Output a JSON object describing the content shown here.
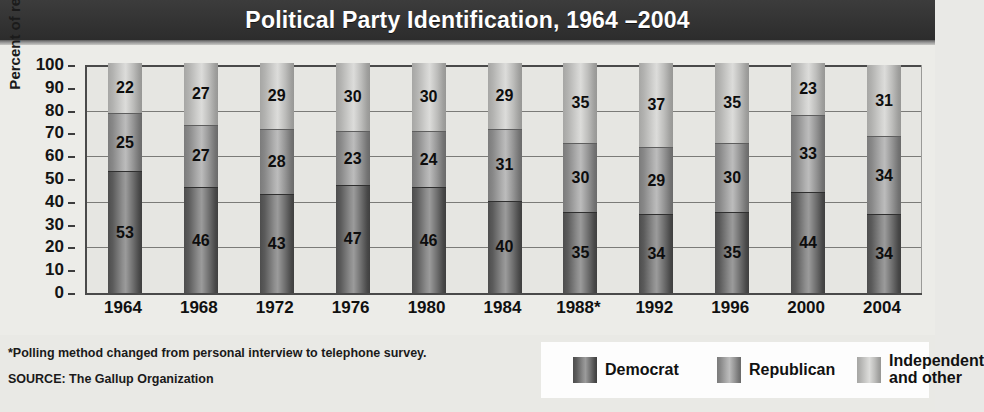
{
  "header": {
    "title": "Political Party Identification, 1964 –2004"
  },
  "footer": {
    "note_asterisk": "*Polling method changed from personal interview to telephone survey.",
    "source": "SOURCE: The Gallup Organization"
  },
  "legend": {
    "items": [
      {
        "label": "Democrat",
        "key": "dem",
        "color": "#6e6e6e"
      },
      {
        "label": "Republican",
        "key": "rep",
        "color": "#9a9a9a"
      },
      {
        "label": "Independent\nand other",
        "key": "ind",
        "color": "#c8c8c6"
      }
    ]
  },
  "chart_data": {
    "type": "bar",
    "subtype": "stacked-column-100",
    "title": "Political Party Identification, 1964 –2004",
    "xlabel": "",
    "ylabel": "Percent of registered voters",
    "ylim": [
      0,
      100
    ],
    "yticks": [
      0,
      10,
      20,
      30,
      40,
      50,
      60,
      70,
      80,
      90,
      100
    ],
    "ytick_labels": [
      "0",
      "10",
      "20",
      "30",
      "40",
      "50",
      "60",
      "70",
      "80",
      "90",
      "100"
    ],
    "gridlines_at": [
      20,
      40,
      60,
      80,
      100
    ],
    "grid": true,
    "legend_position": "bottom-right",
    "categories": [
      "1964",
      "1968",
      "1972",
      "1976",
      "1980",
      "1984",
      "1988*",
      "1992",
      "1996",
      "2000",
      "2004"
    ],
    "series": [
      {
        "name": "Democrat",
        "values": [
          53,
          46,
          43,
          47,
          46,
          40,
          35,
          34,
          35,
          44,
          34
        ]
      },
      {
        "name": "Republican",
        "values": [
          25,
          27,
          28,
          23,
          24,
          31,
          30,
          29,
          30,
          33,
          34
        ]
      },
      {
        "name": "Independent and other",
        "values": [
          22,
          27,
          29,
          30,
          30,
          29,
          35,
          37,
          35,
          23,
          31
        ]
      }
    ],
    "annotations": [
      "*Polling method changed from personal interview to telephone survey."
    ],
    "source": "The Gallup Organization"
  }
}
